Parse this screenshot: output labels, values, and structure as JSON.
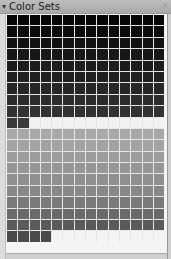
{
  "panel": {
    "title": "Color Sets",
    "collapse_icon": "▾",
    "close_icon": "×"
  },
  "swatch_grid": {
    "columns": 14,
    "rows": [
      {
        "fill": "#060606",
        "count": 14
      },
      {
        "fill": "#0c0c0c",
        "count": 14
      },
      {
        "fill": "#121212",
        "count": 14
      },
      {
        "fill": "#171717",
        "count": 14
      },
      {
        "fill": "#1c1c1c",
        "count": 14
      },
      {
        "fill": "#202020",
        "count": 14
      },
      {
        "fill": "#262626",
        "count": 14
      },
      {
        "fill": "#2c2c2c",
        "count": 14
      },
      {
        "fill": "#333333",
        "count": 14
      },
      {
        "fill": "#3a3a3a",
        "count": 2,
        "rest_fill": "#f2f2f2"
      },
      {
        "fill": "#a9a9a9",
        "count": 14
      },
      {
        "fill": "#a3a3a3",
        "count": 14
      },
      {
        "fill": "#9c9c9c",
        "count": 14
      },
      {
        "fill": "#969696",
        "count": 14
      },
      {
        "fill": "#8f8f8f",
        "count": 14
      },
      {
        "fill": "#888888",
        "count": 14
      },
      {
        "fill": "#7a7a7a",
        "count": 14
      },
      {
        "fill": "#6a6a6a",
        "count": 14
      },
      {
        "fill": "#5a5a5a",
        "count": 14
      },
      {
        "fill": "#4a4a4a",
        "count": 4
      }
    ]
  }
}
